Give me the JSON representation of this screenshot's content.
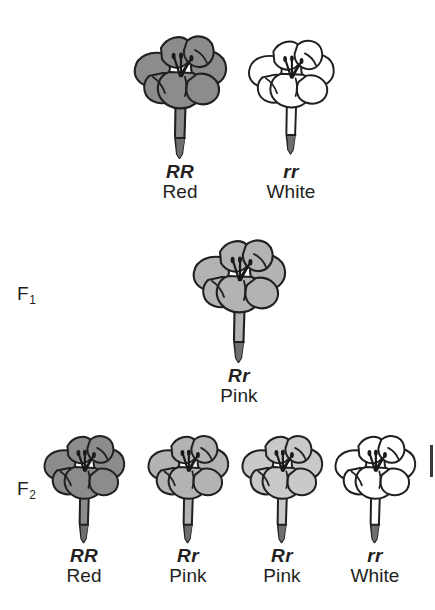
{
  "diagram": {
    "background_color": "#ffffff",
    "ink_color": "#231f20"
  },
  "palette": {
    "red_fill": "#8c8c8c",
    "pink_fill": "#b3b3b3",
    "pink_light_fill": "#c9c9c9",
    "white_fill": "#ffffff",
    "stem_tip_fill": "#6e6e6e",
    "outline": "#231f20"
  },
  "generations": [
    {
      "key": "parental",
      "label": "",
      "label_visible": false,
      "specimens": [
        {
          "genotype": "RR",
          "phenotype": "Red",
          "fill_key": "red_fill",
          "outlined_only": false
        },
        {
          "genotype": "rr",
          "phenotype": "White",
          "fill_key": "white_fill",
          "outlined_only": true
        }
      ]
    },
    {
      "key": "f1",
      "label": "F",
      "label_sub": "1",
      "label_visible": true,
      "specimens": [
        {
          "genotype": "Rr",
          "phenotype": "Pink",
          "fill_key": "pink_fill",
          "outlined_only": false
        }
      ]
    },
    {
      "key": "f2",
      "label": "F",
      "label_sub": "2",
      "label_visible": true,
      "specimens": [
        {
          "genotype": "RR",
          "phenotype": "Red",
          "fill_key": "red_fill",
          "outlined_only": false
        },
        {
          "genotype": "Rr",
          "phenotype": "Pink",
          "fill_key": "pink_fill",
          "outlined_only": false
        },
        {
          "genotype": "Rr",
          "phenotype": "Pink",
          "fill_key": "pink_light_fill",
          "outlined_only": false
        },
        {
          "genotype": "rr",
          "phenotype": "White",
          "fill_key": "white_fill",
          "outlined_only": true
        }
      ]
    }
  ]
}
